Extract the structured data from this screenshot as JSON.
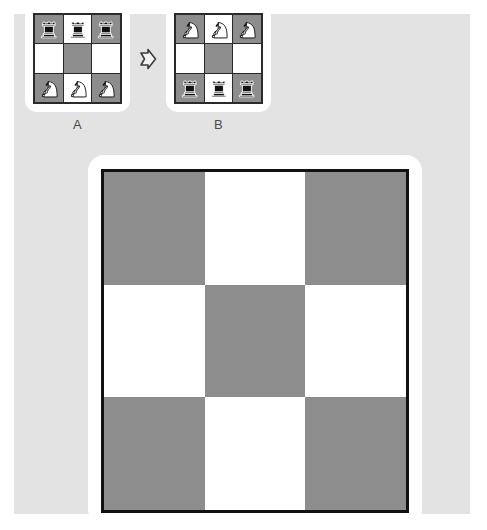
{
  "theme": {
    "page_background": "#ffffff",
    "panel_background": "#e3e3e3",
    "card_background": "#ffffff",
    "light_square": "#ffffff",
    "dark_square": "#8d8d8d",
    "board_border": "#111111",
    "piece_black": "#111111",
    "piece_white": "#ffffff",
    "label_text": "#4a4a4a"
  },
  "example": {
    "arrow_icon": "arrow-right-icon",
    "boards": [
      {
        "label": "A",
        "rows": 3,
        "cols": 3,
        "squares": [
          [
            {
              "shade": "dark",
              "piece": "rook",
              "color": "black"
            },
            {
              "shade": "light",
              "piece": "rook",
              "color": "black"
            },
            {
              "shade": "dark",
              "piece": "rook",
              "color": "black"
            }
          ],
          [
            {
              "shade": "light",
              "piece": null,
              "color": null
            },
            {
              "shade": "dark",
              "piece": null,
              "color": null
            },
            {
              "shade": "light",
              "piece": null,
              "color": null
            }
          ],
          [
            {
              "shade": "dark",
              "piece": "knight",
              "color": "white"
            },
            {
              "shade": "light",
              "piece": "knight",
              "color": "white"
            },
            {
              "shade": "dark",
              "piece": "knight",
              "color": "white"
            }
          ]
        ]
      },
      {
        "label": "B",
        "rows": 3,
        "cols": 3,
        "squares": [
          [
            {
              "shade": "dark",
              "piece": "knight",
              "color": "white"
            },
            {
              "shade": "light",
              "piece": "knight",
              "color": "white"
            },
            {
              "shade": "dark",
              "piece": "knight",
              "color": "white"
            }
          ],
          [
            {
              "shade": "light",
              "piece": null,
              "color": null
            },
            {
              "shade": "dark",
              "piece": null,
              "color": null
            },
            {
              "shade": "light",
              "piece": null,
              "color": null
            }
          ],
          [
            {
              "shade": "dark",
              "piece": "rook",
              "color": "black"
            },
            {
              "shade": "light",
              "piece": "rook",
              "color": "black"
            },
            {
              "shade": "dark",
              "piece": "rook",
              "color": "black"
            }
          ]
        ]
      }
    ]
  },
  "answer_board": {
    "rows": 3,
    "cols": 3,
    "squares": [
      [
        {
          "shade": "dark",
          "piece": null,
          "color": null
        },
        {
          "shade": "light",
          "piece": null,
          "color": null
        },
        {
          "shade": "dark",
          "piece": null,
          "color": null
        }
      ],
      [
        {
          "shade": "light",
          "piece": null,
          "color": null
        },
        {
          "shade": "dark",
          "piece": null,
          "color": null
        },
        {
          "shade": "light",
          "piece": null,
          "color": null
        }
      ],
      [
        {
          "shade": "dark",
          "piece": null,
          "color": null
        },
        {
          "shade": "light",
          "piece": null,
          "color": null
        },
        {
          "shade": "dark",
          "piece": null,
          "color": null
        }
      ]
    ]
  }
}
